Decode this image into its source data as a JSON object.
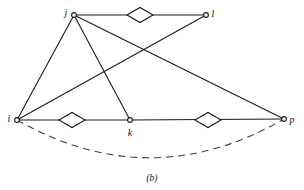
{
  "figure": {
    "caption": "(b)",
    "background_color": "#ffffff",
    "line_color": "#1a1a1a",
    "dashed_color": "#3c3c3c"
  },
  "chart_data": {
    "type": "diagram",
    "title": "(b)",
    "subtitle": "",
    "xlabel": "",
    "ylabel": "",
    "nodes": [
      {
        "id": "j",
        "label": "j",
        "x": 74,
        "y": 15,
        "label_dx": -8,
        "label_dy": -2
      },
      {
        "id": "l",
        "label": "l",
        "x": 206,
        "y": 15,
        "label_dx": 7,
        "label_dy": -1
      },
      {
        "id": "i",
        "label": "i",
        "x": 17,
        "y": 120,
        "label_dx": -8,
        "label_dy": -1
      },
      {
        "id": "k",
        "label": "k",
        "x": 130,
        "y": 120,
        "label_dx": 0,
        "label_dy": 13
      },
      {
        "id": "p",
        "label": "p",
        "x": 284,
        "y": 119,
        "label_dx": 8,
        "label_dy": 1
      }
    ],
    "edges": [
      {
        "from": "j",
        "to": "l",
        "style": "solid",
        "marker": "diamond"
      },
      {
        "from": "j",
        "to": "i",
        "style": "solid",
        "marker": "none"
      },
      {
        "from": "j",
        "to": "k",
        "style": "solid",
        "marker": "none"
      },
      {
        "from": "j",
        "to": "p",
        "style": "solid",
        "marker": "none"
      },
      {
        "from": "i",
        "to": "l",
        "style": "solid",
        "marker": "none"
      },
      {
        "from": "i",
        "to": "k",
        "style": "solid",
        "marker": "diamond"
      },
      {
        "from": "k",
        "to": "p",
        "style": "solid",
        "marker": "diamond"
      },
      {
        "from": "i",
        "to": "p",
        "style": "dashed-arc",
        "marker": "none"
      }
    ],
    "markers": [
      {
        "on_edge": "j-l",
        "x": 140,
        "y": 15,
        "rx": 13,
        "ry": 7.5
      },
      {
        "on_edge": "i-k",
        "x": 72,
        "y": 120,
        "rx": 13,
        "ry": 7.5
      },
      {
        "on_edge": "k-p",
        "x": 208,
        "y": 120,
        "rx": 13,
        "ry": 7.5
      }
    ],
    "node_radius": 2.4,
    "arc_sag_y": 158,
    "legend_position": "none",
    "grid": false
  }
}
